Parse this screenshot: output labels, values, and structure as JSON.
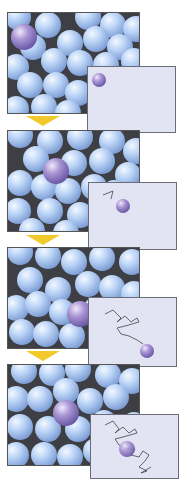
{
  "figure": {
    "colors": {
      "particle": "#b8d2f6",
      "tagged_particle": "#9a88c8",
      "background": "#3d3f44",
      "inset_bg": "#e2e3f3",
      "arrow": "#f2c92c",
      "path_line": "#444444"
    },
    "frames": [
      {
        "step": 1,
        "inset_path_segments": 0
      },
      {
        "step": 2,
        "inset_path_segments": 2
      },
      {
        "step": 3,
        "inset_path_segments": 8
      },
      {
        "step": 4,
        "inset_path_segments": 14
      }
    ]
  }
}
